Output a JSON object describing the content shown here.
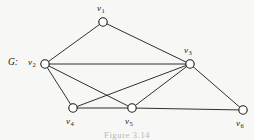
{
  "figure": {
    "graph_name": "G:",
    "caption": "Figure 3.14",
    "background_color": "#f7f7f5",
    "ink_color": "#1a1a18",
    "vertex_fill_color": "#ffffff"
  },
  "chart_data": {
    "type": "diagram",
    "title": "G",
    "nodes": [
      {
        "id": "v1",
        "label": "v",
        "subscript": "1",
        "x": 103,
        "y": 22,
        "label_x": 97,
        "label_y": 4
      },
      {
        "id": "v2",
        "label": "v",
        "subscript": "2",
        "x": 45,
        "y": 64,
        "label_x": 28,
        "label_y": 58
      },
      {
        "id": "v3",
        "label": "v",
        "subscript": "3",
        "x": 190,
        "y": 64,
        "label_x": 184,
        "label_y": 46
      },
      {
        "id": "v4",
        "label": "v",
        "subscript": "4",
        "x": 73,
        "y": 108,
        "label_x": 66,
        "label_y": 117
      },
      {
        "id": "v5",
        "label": "v",
        "subscript": "5",
        "x": 132,
        "y": 108,
        "label_x": 125,
        "label_y": 117
      },
      {
        "id": "v6",
        "label": "v",
        "subscript": "6",
        "x": 243,
        "y": 110,
        "label_x": 236,
        "label_y": 119
      }
    ],
    "edges": [
      {
        "from": "v1",
        "to": "v2"
      },
      {
        "from": "v1",
        "to": "v3"
      },
      {
        "from": "v2",
        "to": "v3"
      },
      {
        "from": "v2",
        "to": "v4"
      },
      {
        "from": "v2",
        "to": "v5"
      },
      {
        "from": "v3",
        "to": "v4"
      },
      {
        "from": "v3",
        "to": "v5"
      },
      {
        "from": "v3",
        "to": "v6"
      },
      {
        "from": "v4",
        "to": "v5"
      },
      {
        "from": "v5",
        "to": "v6"
      }
    ],
    "node_radius": 4.2,
    "edge_count": 10,
    "node_count": 6
  }
}
